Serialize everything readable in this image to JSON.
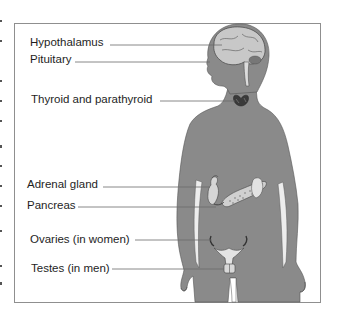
{
  "diagram": {
    "title": "",
    "colors": {
      "silhouette": "#8a8a8a",
      "organs": "#d6d6d6",
      "frame": "#8f8f8f",
      "leader_lines": "#6a6a6a",
      "text": "#1e1e1e"
    },
    "labels": [
      {
        "id": "hypothalamus",
        "text": "Hypothalamus"
      },
      {
        "id": "pituitary",
        "text": "Pituitary"
      },
      {
        "id": "thyroid",
        "text": "Thyroid and parathyroid"
      },
      {
        "id": "adrenal",
        "text": "Adrenal gland"
      },
      {
        "id": "pancreas",
        "text": "Pancreas"
      },
      {
        "id": "ovaries",
        "text": "Ovaries (in women)"
      },
      {
        "id": "testes",
        "text": "Testes (in men)"
      }
    ]
  }
}
